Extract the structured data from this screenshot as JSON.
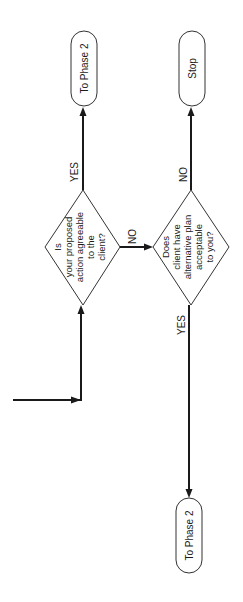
{
  "diagram": {
    "type": "flowchart",
    "orientation": "rotated-90-ccw",
    "nodes": {
      "terminal_phase2_top": {
        "label": "To Phase 2"
      },
      "terminal_stop": {
        "label": "Stop"
      },
      "decision_agreeable": {
        "lines": [
          "Is",
          "your proposed",
          "action agreeable",
          "to the",
          "client?"
        ]
      },
      "decision_alternative": {
        "lines": [
          "Does",
          "client have",
          "alternative plan",
          "acceptable",
          "to you?"
        ]
      },
      "terminal_phase2_bottom": {
        "label": "To Phase 2"
      }
    },
    "edges": {
      "agreeable_yes": "YES",
      "agreeable_no": "NO",
      "alternative_no": "NO",
      "alternative_yes": "YES"
    }
  }
}
